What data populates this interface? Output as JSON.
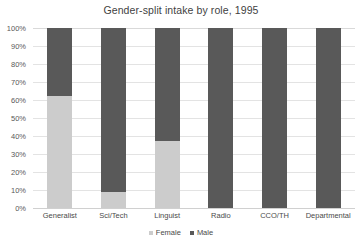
{
  "chart_data": {
    "type": "bar",
    "subtype": "stacked-column-100-percent",
    "title": "Gender-split intake by role, 1995",
    "xlabel": "",
    "ylabel": "",
    "categories": [
      "Generalist",
      "Sci/Tech",
      "Linguist",
      "Radio",
      "CCO/TH",
      "Departmental"
    ],
    "series": [
      {
        "name": "Female",
        "color": "#cccccc",
        "values": [
          62,
          9,
          37,
          0,
          0,
          0
        ]
      },
      {
        "name": "Male",
        "color": "#595959",
        "values": [
          38,
          91,
          63,
          100,
          100,
          100
        ]
      }
    ],
    "ylim": [
      0,
      100
    ],
    "ytick_labels": [
      "100%",
      "90%",
      "80%",
      "70%",
      "60%",
      "50%",
      "40%",
      "30%",
      "20%",
      "10%",
      "0%"
    ],
    "ytick_values": [
      100,
      90,
      80,
      70,
      60,
      50,
      40,
      30,
      20,
      10,
      0
    ],
    "grid": true,
    "grid_axis": "y",
    "legend_position": "bottom",
    "legend_entries": [
      "Female",
      "Male"
    ],
    "value_suffix": "%"
  },
  "colors": {
    "female": "#cccccc",
    "male": "#595959",
    "gridline": "#e3e3e3",
    "text": "#404040",
    "background": "#ffffff"
  }
}
